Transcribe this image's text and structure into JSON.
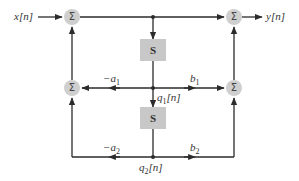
{
  "diagram": {
    "input_label": "x[n]",
    "output_label": "y[n]",
    "sum_symbol": "Σ",
    "delay_symbol": "S",
    "states": [
      {
        "base": "q",
        "sub": "1",
        "suffix": "[n]"
      },
      {
        "base": "q",
        "sub": "2",
        "suffix": "[n]"
      }
    ],
    "coefficients": {
      "neg_a1": {
        "base": "−a",
        "sub": "1"
      },
      "neg_a2": {
        "base": "−a",
        "sub": "2"
      },
      "b1": {
        "base": "b",
        "sub": "1"
      },
      "b2": {
        "base": "b",
        "sub": "2"
      }
    },
    "colors": {
      "line": "#2b2b2b",
      "node_fill": "#cfcfcf",
      "delay_fill": "#c8c8c8",
      "background": "#ffffff"
    }
  }
}
